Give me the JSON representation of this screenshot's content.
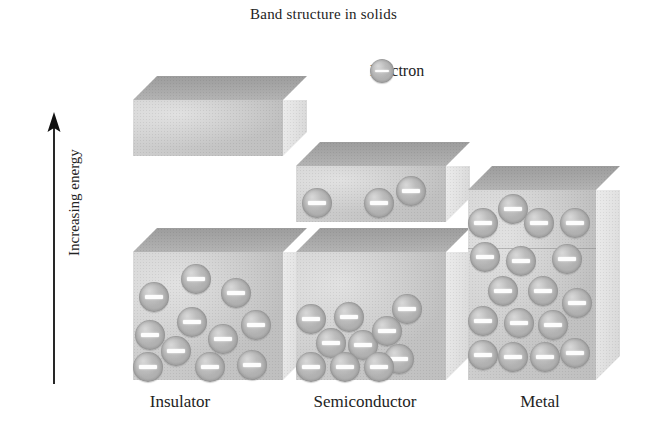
{
  "figure": {
    "title": "Band structure in solids",
    "axis_label": "Increasing energy",
    "axis_icon": "up-arrow-icon"
  },
  "legend": {
    "icon": "electron-sphere-icon",
    "label": "Electron"
  },
  "colors": {
    "background": "#ffffff",
    "text": "#232323",
    "block_top_face": "#a9a9a9",
    "block_front_face": "#c6c6c6",
    "block_right_face": "#e1e1e1",
    "electron_sphere": "#b0b0b0",
    "electron_sign": "#fdfdfd",
    "arrow": "#111111"
  },
  "materials": [
    {
      "id": "insulator",
      "label": "Insulator",
      "label_x": 180,
      "bands": [
        {
          "name": "conduction-band",
          "electron_count": 0,
          "x": 133,
          "y": 100,
          "w": 150,
          "h": 56,
          "depth": 24,
          "electrons": []
        },
        {
          "name": "valence-band",
          "electron_count": 11,
          "x": 133,
          "y": 252,
          "w": 150,
          "h": 128,
          "depth": 24,
          "electrons": [
            {
              "x": 48,
              "y": 12
            },
            {
              "x": 6,
              "y": 30
            },
            {
              "x": 88,
              "y": 26
            },
            {
              "x": 2,
              "y": 68
            },
            {
              "x": 44,
              "y": 55
            },
            {
              "x": 108,
              "y": 58
            },
            {
              "x": 75,
              "y": 72
            },
            {
              "x": 28,
              "y": 84
            },
            {
              "x": 0,
              "y": 100
            },
            {
              "x": 62,
              "y": 100
            },
            {
              "x": 104,
              "y": 98
            }
          ]
        }
      ]
    },
    {
      "id": "semiconductor",
      "label": "Semiconductor",
      "label_x": 365,
      "bands": [
        {
          "name": "conduction-band",
          "electron_count": 3,
          "x": 296,
          "y": 166,
          "w": 150,
          "h": 56,
          "depth": 24,
          "electrons": [
            {
              "x": 6,
              "y": 22
            },
            {
              "x": 68,
              "y": 22
            },
            {
              "x": 100,
              "y": 10
            }
          ]
        },
        {
          "name": "valence-band",
          "electron_count": 10,
          "x": 296,
          "y": 252,
          "w": 150,
          "h": 128,
          "depth": 24,
          "electrons": [
            {
              "x": 0,
              "y": 52
            },
            {
              "x": 38,
              "y": 50
            },
            {
              "x": 96,
              "y": 42
            },
            {
              "x": 20,
              "y": 76
            },
            {
              "x": 52,
              "y": 78
            },
            {
              "x": 76,
              "y": 64
            },
            {
              "x": 88,
              "y": 92
            },
            {
              "x": 0,
              "y": 100
            },
            {
              "x": 34,
              "y": 100
            },
            {
              "x": 68,
              "y": 100
            }
          ]
        }
      ]
    },
    {
      "id": "metal",
      "label": "Metal",
      "label_x": 540,
      "bands": [
        {
          "name": "overlapping-bands",
          "electron_count": 17,
          "x": 468,
          "y": 190,
          "w": 128,
          "h": 190,
          "depth": 24,
          "split_at": 58,
          "electrons": [
            {
              "x": 30,
              "y": 4
            },
            {
              "x": 0,
              "y": 18
            },
            {
              "x": 56,
              "y": 18
            },
            {
              "x": 92,
              "y": 18
            },
            {
              "x": 2,
              "y": 52
            },
            {
              "x": 38,
              "y": 56
            },
            {
              "x": 84,
              "y": 54
            },
            {
              "x": 20,
              "y": 86
            },
            {
              "x": 60,
              "y": 86
            },
            {
              "x": 0,
              "y": 116
            },
            {
              "x": 36,
              "y": 118
            },
            {
              "x": 70,
              "y": 120
            },
            {
              "x": 94,
              "y": 98
            },
            {
              "x": 0,
              "y": 150
            },
            {
              "x": 30,
              "y": 152
            },
            {
              "x": 62,
              "y": 152
            },
            {
              "x": 92,
              "y": 148
            }
          ]
        }
      ]
    }
  ]
}
